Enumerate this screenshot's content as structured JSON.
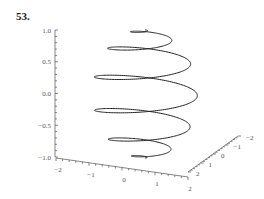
{
  "problem": {
    "number": "53."
  },
  "chart_data": {
    "type": "line",
    "subtype": "3d-parametric-curve",
    "title": "",
    "curve": {
      "k": 12,
      "t_range": [
        0,
        3.14159
      ],
      "samples": 900
    },
    "axes": {
      "z": {
        "label": "",
        "ticks": [
          "1.0",
          "0.5",
          "0.0",
          "−0.5",
          "−1.0"
        ],
        "range": [
          -1,
          1
        ]
      },
      "x": {
        "label": "",
        "ticks": [
          "−2",
          "−1",
          "0",
          "1",
          "2"
        ],
        "range": [
          -2,
          2
        ]
      },
      "y": {
        "label": "",
        "ticks": [
          "2",
          "1",
          "0",
          "−1",
          "−2"
        ],
        "range": [
          -2,
          2
        ]
      }
    },
    "grid": false,
    "legend": null
  }
}
